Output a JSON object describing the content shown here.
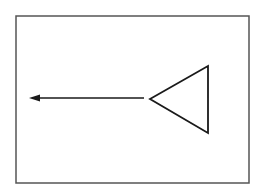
{
  "diagram": {
    "background": "#ffffff",
    "stroke_color": "#1a1a1a",
    "frame": {
      "x1": 16,
      "y1": 16,
      "x2": 249,
      "y2": 183,
      "stroke_color": "#555555",
      "stroke_width": 1.5
    },
    "arrow": {
      "from_x": 144,
      "from_y": 98,
      "to_x": 29,
      "to_y": 98,
      "direction": "left",
      "stroke_width": 1.6
    },
    "triangle": {
      "points": "150,99 208,66 208,133",
      "orientation": "pointing-left",
      "stroke_width": 1.8
    }
  }
}
